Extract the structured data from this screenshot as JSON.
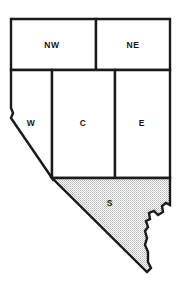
{
  "figure": {
    "background_color": "#ffffff",
    "outline_color": "#1a1a1a",
    "shaded_fill_color": "#d8d8d8",
    "unshaded_fill_color": "#ffffff"
  },
  "map": {
    "width": 180,
    "height": 286,
    "regions": [
      {
        "id": "nw",
        "label": "NW",
        "shaded": false,
        "label_x": 52,
        "label_y": 46,
        "path": "M 11,19 L 96,19 L 96,70 L 11,70 Z"
      },
      {
        "id": "ne",
        "label": "NE",
        "shaded": false,
        "label_x": 133,
        "label_y": 46,
        "path": "M 96,19 L 170,19 L 170,70 L 96,70 Z"
      },
      {
        "id": "w",
        "label": "W",
        "shaded": false,
        "label_x": 31,
        "label_y": 124,
        "path": "M 11,70 L 52,70 L 52,178 L 11,118 L 13,113 L 11,108 Z"
      },
      {
        "id": "c",
        "label": "C",
        "shaded": false,
        "label_x": 83,
        "label_y": 124,
        "path": "M 52,70 L 115,70 L 115,178 L 52,178 Z"
      },
      {
        "id": "e",
        "label": "E",
        "shaded": false,
        "label_x": 142,
        "label_y": 124,
        "path": "M 115,70 L 170,70 L 170,178 L 115,178 Z"
      },
      {
        "id": "s",
        "label": "S",
        "shaded": true,
        "label_x": 110,
        "label_y": 204,
        "path": "M 52,178 L 170,178 L 170,205 L 166,203 L 162,206 L 163,212 L 158,215 L 154,211 L 149,213 L 150,219 L 146,221 L 148,227 L 145,231 L 147,238 L 145,245 L 148,252 L 148,262 L 151,268 L 147,272 Z"
      }
    ],
    "outer_boundary_path": "M 11,19 L 170,19 L 170,205 L 166,203 L 162,206 L 163,212 L 158,215 L 154,211 L 149,213 L 150,219 L 146,221 L 148,227 L 145,231 L 147,238 L 145,245 L 148,252 L 148,262 L 151,268 L 147,272 L 11,118 L 13,113 L 11,108 Z"
  }
}
